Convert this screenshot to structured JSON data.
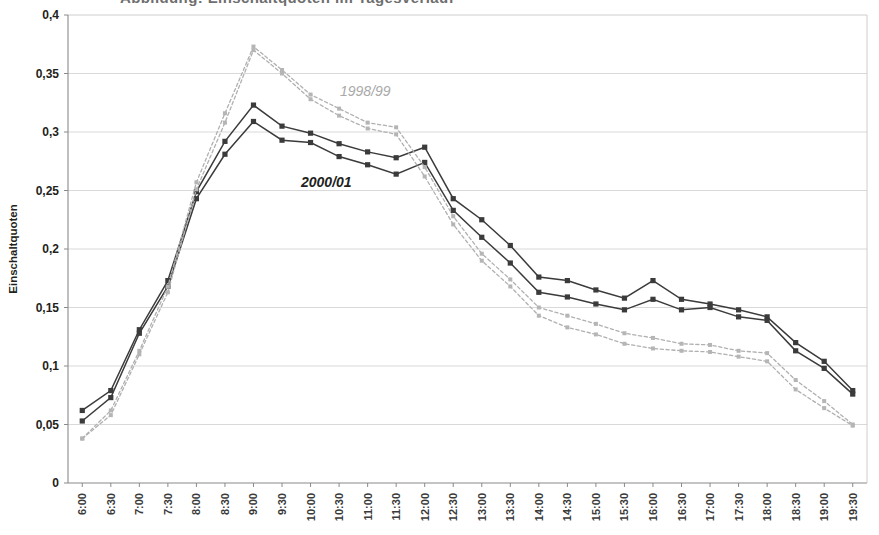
{
  "figure": {
    "cropped_title": "Abbildung: Einschaltquoten im Tagesverlauf",
    "ylabel": "Einschaltquoten",
    "y_ticks": [
      "0",
      "0,05",
      "0,1",
      "0,15",
      "0,2",
      "0,25",
      "0,3",
      "0,35",
      "0,4"
    ],
    "series_annotations": [
      {
        "name": "label-1998-99",
        "text": "1998/99",
        "x": 340,
        "y": 96,
        "color": "#a9a9a9"
      },
      {
        "name": "label-2000-01",
        "text": "2000/01",
        "x": 301,
        "y": 187,
        "color": "#231f20"
      }
    ]
  },
  "chart_data": {
    "type": "line",
    "title": "",
    "xlabel": "",
    "ylabel": "Einschaltquoten",
    "ylim": [
      0,
      0.4
    ],
    "ytick_values": [
      0,
      0.05,
      0.1,
      0.15,
      0.2,
      0.25,
      0.3,
      0.35,
      0.4
    ],
    "grid": true,
    "legend": "inline-annotation",
    "decimal_separator": ",",
    "categories": [
      "6:00",
      "6:30",
      "7:00",
      "7:30",
      "8:00",
      "8:30",
      "9:00",
      "9:30",
      "10:00",
      "10:30",
      "11:00",
      "11:30",
      "12:00",
      "12:30",
      "13:00",
      "13:30",
      "14:00",
      "14:30",
      "15:00",
      "15:30",
      "16:00",
      "16:30",
      "17:00",
      "17:30",
      "18:00",
      "18:30",
      "19:00",
      "19:30"
    ],
    "series": [
      {
        "name": "2000/01 a",
        "style": "solid-dark-square",
        "color": "#3b3b3b",
        "values": [
          0.062,
          0.079,
          0.131,
          0.173,
          0.249,
          0.292,
          0.323,
          0.305,
          0.299,
          0.29,
          0.283,
          0.278,
          0.287,
          0.243,
          0.225,
          0.203,
          0.176,
          0.173,
          0.165,
          0.158,
          0.173,
          0.157,
          0.153,
          0.148,
          0.142,
          0.12,
          0.104,
          0.079
        ]
      },
      {
        "name": "2000/01 b",
        "style": "solid-dark-square",
        "color": "#3b3b3b",
        "values": [
          0.053,
          0.073,
          0.128,
          0.168,
          0.243,
          0.281,
          0.309,
          0.293,
          0.291,
          0.279,
          0.272,
          0.264,
          0.274,
          0.233,
          0.21,
          0.188,
          0.163,
          0.159,
          0.153,
          0.148,
          0.157,
          0.148,
          0.15,
          0.142,
          0.139,
          0.113,
          0.098,
          0.076
        ]
      },
      {
        "name": "1998/99 a",
        "style": "dotted-grey",
        "color": "#b0b0b0",
        "values": [
          0.038,
          0.062,
          0.113,
          0.168,
          0.257,
          0.316,
          0.373,
          0.353,
          0.332,
          0.32,
          0.308,
          0.304,
          0.27,
          0.228,
          0.196,
          0.174,
          0.15,
          0.143,
          0.136,
          0.128,
          0.124,
          0.119,
          0.118,
          0.113,
          0.111,
          0.088,
          0.07,
          0.05
        ]
      },
      {
        "name": "1998/99 b",
        "style": "dotted-grey",
        "color": "#b5b5b5",
        "values": [
          0.038,
          0.058,
          0.11,
          0.163,
          0.251,
          0.308,
          0.37,
          0.35,
          0.328,
          0.314,
          0.303,
          0.298,
          0.262,
          0.221,
          0.19,
          0.168,
          0.143,
          0.133,
          0.127,
          0.119,
          0.115,
          0.113,
          0.112,
          0.108,
          0.104,
          0.08,
          0.064,
          0.049
        ]
      }
    ]
  }
}
